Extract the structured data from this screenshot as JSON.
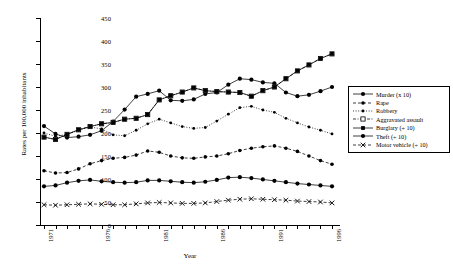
{
  "chart_data": {
    "type": "line",
    "title": "",
    "xlabel": "Year",
    "ylabel": "Rates per 100,000 inhabitants",
    "xlim": [
      1971,
      1996
    ],
    "ylim": [
      0,
      450
    ],
    "ytick_step": 50,
    "grid": false,
    "legend_position": "right",
    "x": [
      1971,
      1972,
      1973,
      1974,
      1975,
      1976,
      1977,
      1978,
      1979,
      1980,
      1981,
      1982,
      1983,
      1984,
      1985,
      1986,
      1987,
      1988,
      1989,
      1990,
      1991,
      1992,
      1993,
      1994,
      1995,
      1996
    ],
    "xtick_labels": [
      "1971",
      "1976",
      "1981",
      "1986",
      "1991",
      "1996"
    ],
    "ytick_labels": [
      "0",
      "50",
      "100",
      "150",
      "200",
      "250",
      "300",
      "350",
      "400",
      "450"
    ],
    "series": [
      {
        "name": "Murder (x 10)",
        "marker": "filled-circle",
        "line": "solid",
        "values": [
          215,
          198,
          190,
          192,
          196,
          205,
          225,
          251,
          279,
          285,
          292,
          271,
          270,
          273,
          285,
          288,
          305,
          318,
          316,
          310,
          308,
          288,
          280,
          283,
          291,
          300
        ]
      },
      {
        "name": "Rape",
        "marker": "filled-circle-small",
        "line": "dashed",
        "values": [
          118,
          113,
          114,
          122,
          133,
          140,
          145,
          147,
          152,
          161,
          158,
          150,
          146,
          145,
          148,
          150,
          155,
          162,
          167,
          170,
          172,
          167,
          160,
          150,
          140,
          132
        ]
      },
      {
        "name": "Robbery",
        "marker": "filled-circle-tiny",
        "line": "dotted",
        "values": [
          200,
          193,
          197,
          206,
          213,
          209,
          196,
          194,
          206,
          220,
          230,
          222,
          214,
          210,
          212,
          226,
          241,
          255,
          258,
          250,
          245,
          232,
          222,
          213,
          206,
          198
        ]
      },
      {
        "name": "Aggravated assault",
        "marker": "open-square",
        "line": "dash-dot",
        "values": [
          191,
          186,
          197,
          207,
          214,
          220,
          223,
          230,
          232,
          240,
          272,
          281,
          289,
          298,
          292,
          290,
          289,
          288,
          280,
          292,
          300,
          318,
          335,
          348,
          362,
          372
        ]
      },
      {
        "name": "Burglary (÷ 10)",
        "marker": "filled-square",
        "line": "solid",
        "values": [
          191,
          186,
          197,
          207,
          214,
          220,
          223,
          230,
          232,
          240,
          272,
          281,
          289,
          298,
          292,
          290,
          289,
          288,
          280,
          292,
          300,
          318,
          335,
          348,
          362,
          372
        ]
      },
      {
        "name": "Theft (÷ 10)",
        "marker": "filled-circle",
        "line": "solid",
        "values": [
          84,
          86,
          92,
          96,
          98,
          95,
          93,
          92,
          93,
          97,
          97,
          95,
          93,
          92,
          94,
          98,
          103,
          104,
          102,
          99,
          96,
          93,
          90,
          88,
          86,
          84
        ]
      },
      {
        "name": "Motor vehicle (÷ 10)",
        "marker": "x-cross",
        "line": "dashed",
        "values": [
          44,
          43,
          44,
          45,
          46,
          45,
          44,
          44,
          46,
          48,
          49,
          48,
          47,
          47,
          48,
          51,
          54,
          56,
          57,
          56,
          55,
          54,
          52,
          51,
          50,
          48
        ]
      }
    ]
  },
  "legend": {
    "items": [
      {
        "label": "Murder (x 10)"
      },
      {
        "label": "Rape"
      },
      {
        "label": "Robbery"
      },
      {
        "label": "Aggravated assault"
      },
      {
        "label": "Burglary (÷ 10)"
      },
      {
        "label": "Theft (÷ 10)"
      },
      {
        "label": "Motor vehicle (÷ 10)"
      }
    ]
  }
}
